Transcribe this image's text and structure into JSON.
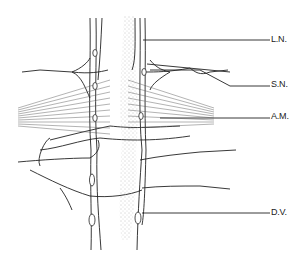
{
  "diagram": {
    "type": "anatomical line drawing",
    "labels": [
      {
        "id": "ln",
        "text": "L.N.",
        "x": 271,
        "y": 34,
        "leader_from": [
          143,
          40
        ]
      },
      {
        "id": "sn",
        "text": "S.N.",
        "x": 271,
        "y": 79,
        "leader_from": [
          225,
          86
        ]
      },
      {
        "id": "am",
        "text": "A.M.",
        "x": 271,
        "y": 111,
        "leader_from": [
          212,
          118
        ]
      },
      {
        "id": "dv",
        "text": "D.V.",
        "x": 271,
        "y": 207,
        "leader_from": [
          142,
          213
        ]
      }
    ]
  }
}
